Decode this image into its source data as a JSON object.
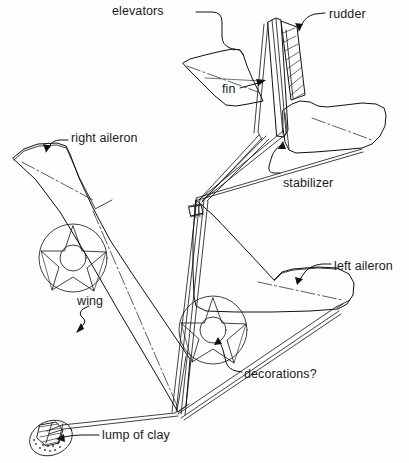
{
  "figure": {
    "style": "line drawing, black ink on white",
    "colors": {
      "ink": "#111111",
      "background": "#ffffff",
      "centerline": "#333333"
    }
  },
  "labels": {
    "elevators": "elevators",
    "rudder": "rudder",
    "fin": "fin",
    "right_aileron": "right aileron",
    "stabilizer": "stabilizer",
    "left_aileron": "left aileron",
    "wing": "wing",
    "decorations": "decorations?",
    "lump_of_clay": "lump of clay"
  },
  "callouts": [
    {
      "name": "elevators",
      "text": "elevators",
      "x": 112,
      "y": 5,
      "target_x": 234,
      "target_y": 49
    },
    {
      "name": "rudder",
      "text": "rudder",
      "x": 329,
      "y": 8,
      "target_x": 300,
      "target_y": 32
    },
    {
      "name": "fin",
      "text": "fin",
      "x": 222,
      "y": 83,
      "target_x": 266,
      "target_y": 80
    },
    {
      "name": "right-aileron",
      "text": "right aileron",
      "x": 71,
      "y": 132,
      "target_x": 47,
      "target_y": 150
    },
    {
      "name": "stabilizer",
      "text": "stabilizer",
      "x": 283,
      "y": 177,
      "target_x": 283,
      "target_y": 145
    },
    {
      "name": "left-aileron",
      "text": "left aileron",
      "x": 334,
      "y": 260,
      "target_x": 297,
      "target_y": 285
    },
    {
      "name": "wing",
      "text": "wing",
      "x": 77,
      "y": 295,
      "target_x": 82,
      "target_y": 330
    },
    {
      "name": "decorations",
      "text": "decorations?",
      "x": 244,
      "y": 368,
      "target_x": 219,
      "target_y": 340
    },
    {
      "name": "lump-of-clay",
      "text": "lump of clay",
      "x": 102,
      "y": 429,
      "target_x": 56,
      "target_y": 437
    }
  ],
  "parts": [
    {
      "name": "wing",
      "label": "wing",
      "kind": "lifting-surface"
    },
    {
      "name": "right-aileron",
      "label": "right aileron",
      "kind": "control-surface"
    },
    {
      "name": "left-aileron",
      "label": "left aileron",
      "kind": "control-surface"
    },
    {
      "name": "stabilizer",
      "label": "stabilizer",
      "kind": "tail-surface"
    },
    {
      "name": "elevators",
      "label": "elevators",
      "kind": "control-surface"
    },
    {
      "name": "fin",
      "label": "fin",
      "kind": "tail-surface"
    },
    {
      "name": "rudder",
      "label": "rudder",
      "kind": "control-surface"
    },
    {
      "name": "decorations",
      "label": "decorations?",
      "kind": "marking"
    },
    {
      "name": "lump-of-clay",
      "label": "lump of clay",
      "kind": "ballast"
    }
  ],
  "decorations": [
    {
      "name": "star-roundel-right-wing",
      "cx": 73,
      "cy": 258,
      "r": 34
    },
    {
      "name": "star-roundel-left-wing",
      "cx": 213,
      "cy": 330,
      "r": 34
    }
  ]
}
